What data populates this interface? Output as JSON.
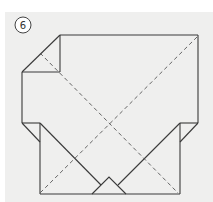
{
  "diagram": {
    "step_number": "6",
    "colors": {
      "background": "#efefee",
      "line": "#3a3a3a",
      "dashed": "#555555"
    }
  }
}
